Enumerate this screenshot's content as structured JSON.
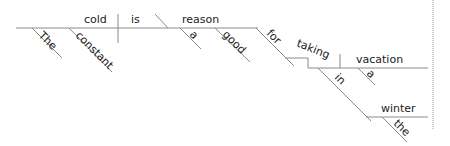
{
  "diagram": {
    "type": "Reed-Kellogg sentence diagram",
    "sentence": "The constant cold is reason a good for taking vacation a in winter the",
    "words": {
      "subject": "cold",
      "verb": "is",
      "complement": "reason",
      "subject_mod_1": "The",
      "subject_mod_2": "constant",
      "complement_mod_1": "a",
      "complement_mod_2": "good",
      "preposition_1": "for",
      "gerund": "taking",
      "gerund_object": "vacation",
      "object_mod": "a",
      "preposition_2": "in",
      "prep_object": "winter",
      "prep_object_mod": "the"
    },
    "colors": {
      "line": "#8a8a8a",
      "text": "#222222"
    }
  }
}
